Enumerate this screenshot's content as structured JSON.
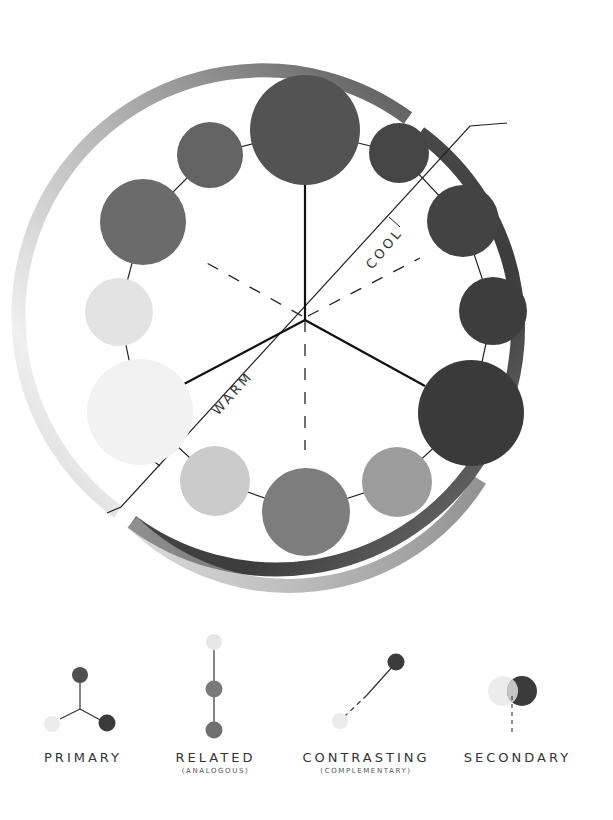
{
  "diagram": {
    "type": "color-wheel",
    "center": [
      305,
      320
    ],
    "ring": {
      "gradient_stops": [
        "#f0f0f0",
        "#a6a6a6",
        "#5a5a5a",
        "#3a3a3a",
        "#3f3f3f",
        "#6a6a6a",
        "#a0a0a0",
        "#c6c6c6"
      ]
    },
    "regions": {
      "cool_label": "COOL",
      "warm_label": "WARM"
    },
    "swatches": [
      {
        "id": "top",
        "cx": 305,
        "cy": 130,
        "r": 55,
        "fill": "#535353",
        "size": "large"
      },
      {
        "id": "top-right",
        "cx": 399,
        "cy": 153,
        "r": 30,
        "fill": "#454545",
        "size": "small"
      },
      {
        "id": "right-upper",
        "cx": 463,
        "cy": 221,
        "r": 36,
        "fill": "#434343",
        "size": "medium"
      },
      {
        "id": "right",
        "cx": 493,
        "cy": 311,
        "r": 34,
        "fill": "#3d3d3d",
        "size": "small"
      },
      {
        "id": "right-lower",
        "cx": 471,
        "cy": 413,
        "r": 53,
        "fill": "#3a3a3a",
        "size": "large"
      },
      {
        "id": "bottom-right",
        "cx": 397,
        "cy": 482,
        "r": 35,
        "fill": "#9c9c9c",
        "size": "small"
      },
      {
        "id": "bottom",
        "cx": 306,
        "cy": 512,
        "r": 44,
        "fill": "#7d7d7d",
        "size": "medium"
      },
      {
        "id": "bottom-left",
        "cx": 215,
        "cy": 481,
        "r": 35,
        "fill": "#cbcbcb",
        "size": "small"
      },
      {
        "id": "left-lower",
        "cx": 140,
        "cy": 412,
        "r": 53,
        "fill": "#f2f2f2",
        "size": "large"
      },
      {
        "id": "left",
        "cx": 119,
        "cy": 312,
        "r": 34,
        "fill": "#e3e3e3",
        "size": "small"
      },
      {
        "id": "left-upper",
        "cx": 143,
        "cy": 222,
        "r": 43,
        "fill": "#6b6b6b",
        "size": "medium"
      },
      {
        "id": "top-left",
        "cx": 210,
        "cy": 155,
        "r": 33,
        "fill": "#636363",
        "size": "small"
      }
    ]
  },
  "legend": {
    "items": [
      {
        "id": "primary",
        "label": "PRIMARY",
        "sublabel": ""
      },
      {
        "id": "related",
        "label": "RELATED",
        "sublabel": "(ANALOGOUS)"
      },
      {
        "id": "contrasting",
        "label": "CONTRASTING",
        "sublabel": "(COMPLEMENTARY)"
      },
      {
        "id": "secondary",
        "label": "SECONDARY",
        "sublabel": ""
      }
    ],
    "colors": {
      "dark": "#3b3b3b",
      "mid_dark": "#505050",
      "mid": "#6f6f6f",
      "light": "#ececec",
      "overlap": "#c4c4c4"
    }
  }
}
